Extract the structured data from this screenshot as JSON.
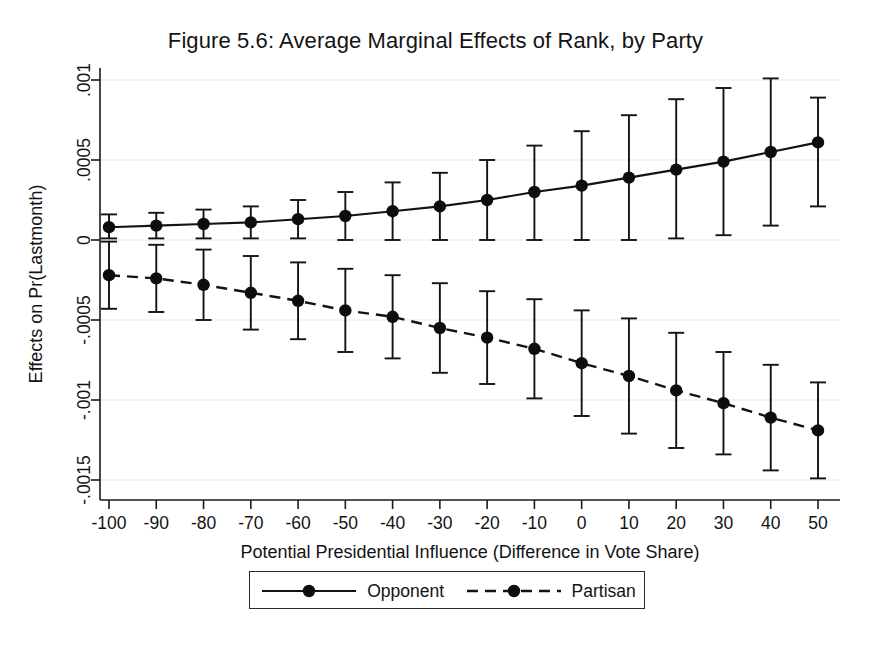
{
  "figure": {
    "title": "Figure 5.6: Average Marginal Effects of Rank, by Party"
  },
  "chart_data": {
    "type": "line",
    "title": "Figure 5.6: Average Marginal Effects of Rank, by Party",
    "xlabel": "Potential Presidential Influence (Difference in Vote Share)",
    "ylabel": "Effects on Pr(Lastmonth)",
    "x": [
      -100,
      -90,
      -80,
      -70,
      -60,
      -50,
      -40,
      -30,
      -20,
      -10,
      0,
      10,
      20,
      30,
      40,
      50
    ],
    "xlim": [
      -105,
      55
    ],
    "ylim": [
      -0.0016,
      0.0011
    ],
    "xticks": [
      -100,
      -90,
      -80,
      -70,
      -60,
      -50,
      -40,
      -30,
      -20,
      -10,
      0,
      10,
      20,
      30,
      40,
      50
    ],
    "xtick_labels": [
      "-100",
      "-90",
      "-80",
      "-70",
      "-60",
      "-50",
      "-40",
      "-30",
      "-20",
      "-10",
      "0",
      "10",
      "20",
      "30",
      "40",
      "50"
    ],
    "yticks": [
      0.001,
      0.0005,
      0,
      -0.0005,
      -0.001,
      -0.0015
    ],
    "ytick_labels": [
      ".001",
      ".0005",
      "0",
      "-.0005",
      "-.001",
      "-.0015"
    ],
    "grid": true,
    "legend_position": "bottom",
    "error_bars": "95% confidence interval",
    "series": [
      {
        "name": "Opponent",
        "linestyle": "solid",
        "marker": "circle",
        "color": "#131313",
        "values": [
          8e-05,
          9e-05,
          0.0001,
          0.00011,
          0.00013,
          0.00015,
          0.00018,
          0.00021,
          0.00025,
          0.0003,
          0.00034,
          0.00039,
          0.00044,
          0.00049,
          0.00055,
          0.00061
        ],
        "ci_low": [
          1e-05,
          1e-05,
          1e-05,
          1e-05,
          1e-05,
          0.0,
          0.0,
          0.0,
          0.0,
          0.0,
          0.0,
          0.0,
          1e-05,
          3e-05,
          9e-05,
          0.00021
        ],
        "ci_high": [
          0.00016,
          0.00017,
          0.00019,
          0.00021,
          0.00025,
          0.0003,
          0.00036,
          0.00042,
          0.0005,
          0.00059,
          0.00068,
          0.00078,
          0.00088,
          0.00095,
          0.00101,
          0.00089
        ]
      },
      {
        "name": "Partisan",
        "linestyle": "dashed",
        "marker": "circle",
        "color": "#131313",
        "values": [
          -0.00022,
          -0.00024,
          -0.00028,
          -0.00033,
          -0.00038,
          -0.00044,
          -0.00048,
          -0.00055,
          -0.00061,
          -0.00068,
          -0.00077,
          -0.00085,
          -0.00094,
          -0.00102,
          -0.00111,
          -0.00119
        ],
        "ci_low": [
          -0.00043,
          -0.00045,
          -0.0005,
          -0.00056,
          -0.00062,
          -0.0007,
          -0.00074,
          -0.00083,
          -0.0009,
          -0.00099,
          -0.0011,
          -0.00121,
          -0.0013,
          -0.00134,
          -0.00144,
          -0.00149
        ],
        "ci_high": [
          -1e-05,
          -3e-05,
          -6e-05,
          -0.0001,
          -0.00014,
          -0.00018,
          -0.00022,
          -0.00027,
          -0.00032,
          -0.00037,
          -0.00044,
          -0.00049,
          -0.00058,
          -0.0007,
          -0.00078,
          -0.00089
        ]
      }
    ]
  },
  "legend": {
    "items": [
      {
        "label": "Opponent",
        "style": "solid"
      },
      {
        "label": "Partisan",
        "style": "dashed"
      }
    ]
  }
}
